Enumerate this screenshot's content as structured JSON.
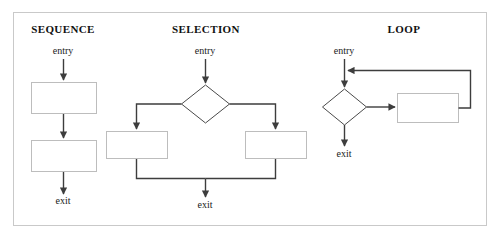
{
  "figure": {
    "kind": "control-flow-structures-diagram",
    "frame": {
      "border_color": "#c9c9c9",
      "background": "#ffffff"
    },
    "line_color": "#3d3d3d",
    "box_stroke_color": "#bdbdbd",
    "diamond_stroke_color": "#4a4a4a"
  },
  "panels": [
    {
      "id": "sequence",
      "title": "SEQUENCE",
      "entry_label": "entry",
      "exit_label": "exit",
      "nodes": [
        {
          "type": "process",
          "label": ""
        },
        {
          "type": "process",
          "label": ""
        }
      ]
    },
    {
      "id": "selection",
      "title": "SELECTION",
      "entry_label": "entry",
      "exit_label": "exit",
      "nodes": [
        {
          "type": "decision",
          "label": ""
        },
        {
          "type": "process",
          "label": ""
        },
        {
          "type": "process",
          "label": ""
        }
      ]
    },
    {
      "id": "loop",
      "title": "LOOP",
      "entry_label": "entry",
      "exit_label": "exit",
      "nodes": [
        {
          "type": "decision",
          "label": ""
        },
        {
          "type": "process",
          "label": ""
        }
      ]
    }
  ]
}
